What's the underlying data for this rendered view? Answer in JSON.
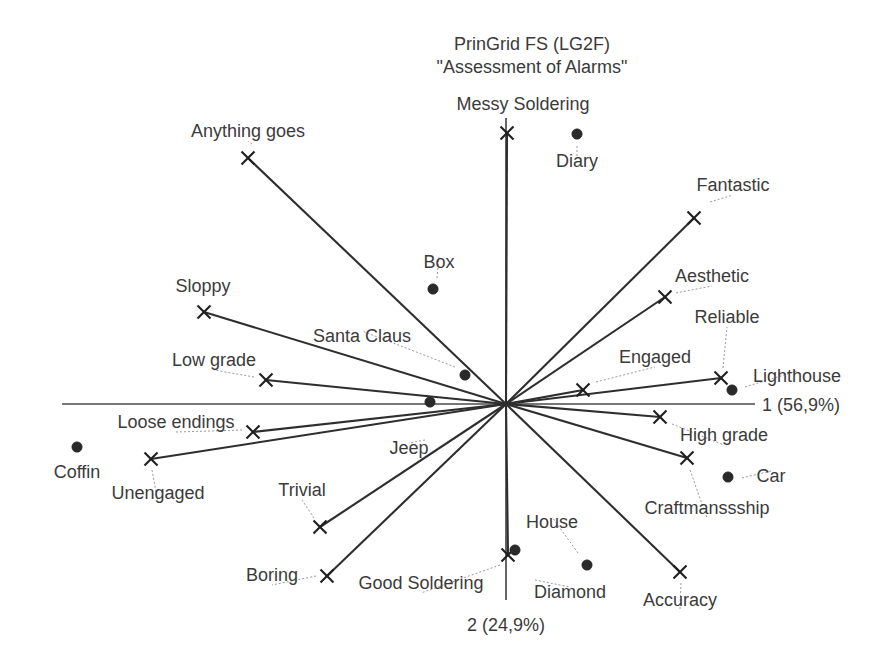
{
  "chart_data": {
    "type": "scatter",
    "title_line1": "PrinGrid FS (LG2F)",
    "title_line2": "\"Assessment of Alarms\"",
    "xlabel": "1 (56,9%)",
    "ylabel": "2 (24,9%)",
    "grid": false,
    "legend": "none",
    "axis_variance": {
      "component_1_percent": "56,9%",
      "component_2_percent": "24,9%"
    },
    "origin": {
      "x": 506,
      "y": 404
    },
    "axis_extent": {
      "x_min": 62,
      "x_max": 755,
      "y_min": 118,
      "y_max": 600
    },
    "constructs": [
      {
        "name": "Messy Soldering",
        "x": 507,
        "y": 133,
        "label_x": 523,
        "label_y": 110,
        "anchor": "middle",
        "leader": false
      },
      {
        "name": "Anything goes",
        "x": 248,
        "y": 158,
        "label_x": 248,
        "label_y": 137,
        "anchor": "middle",
        "leader": true,
        "leader_x": 252,
        "leader_y": 144
      },
      {
        "name": "Fantastic",
        "x": 694,
        "y": 218,
        "label_x": 733,
        "label_y": 191,
        "anchor": "middle",
        "leader": true,
        "leader_x": 710,
        "leader_y": 202
      },
      {
        "name": "Sloppy",
        "x": 204,
        "y": 312,
        "label_x": 203,
        "label_y": 292,
        "anchor": "middle",
        "leader": false
      },
      {
        "name": "Aesthetic",
        "x": 665,
        "y": 297,
        "label_x": 712,
        "label_y": 282,
        "anchor": "middle",
        "leader": true,
        "leader_x": 676,
        "leader_y": 293
      },
      {
        "name": "Reliable",
        "x": 721,
        "y": 378,
        "label_x": 727,
        "label_y": 323,
        "anchor": "middle",
        "leader": true,
        "leader_x": 723,
        "leader_y": 368
      },
      {
        "name": "Low grade",
        "x": 266,
        "y": 380,
        "label_x": 214,
        "label_y": 366,
        "anchor": "middle",
        "leader": true,
        "leader_x": 254,
        "leader_y": 377
      },
      {
        "name": "Engaged",
        "x": 583,
        "y": 390,
        "label_x": 655,
        "label_y": 363,
        "anchor": "middle",
        "leader": true,
        "leader_x": 596,
        "leader_y": 382
      },
      {
        "name": "Loose endings",
        "x": 253,
        "y": 432,
        "label_x": 176,
        "label_y": 428,
        "anchor": "middle",
        "leader": true,
        "leader_x": 242,
        "leader_y": 430
      },
      {
        "name": "High grade",
        "x": 660,
        "y": 417,
        "label_x": 724,
        "label_y": 441,
        "anchor": "middle",
        "leader": true,
        "leader_x": 672,
        "leader_y": 424
      },
      {
        "name": "Unengaged",
        "x": 151,
        "y": 459,
        "label_x": 158,
        "label_y": 499,
        "anchor": "middle",
        "leader": true,
        "leader_x": 152,
        "leader_y": 470
      },
      {
        "name": "Craftmanssship",
        "x": 687,
        "y": 458,
        "label_x": 707,
        "label_y": 514,
        "anchor": "middle",
        "leader": true,
        "leader_x": 690,
        "leader_y": 470
      },
      {
        "name": "Trivial",
        "x": 320,
        "y": 527,
        "label_x": 302,
        "label_y": 496,
        "anchor": "middle",
        "leader": true,
        "leader_x": 314,
        "leader_y": 518
      },
      {
        "name": "Boring",
        "x": 327,
        "y": 576,
        "label_x": 272,
        "label_y": 581,
        "anchor": "middle",
        "leader": true,
        "leader_x": 316,
        "leader_y": 576
      },
      {
        "name": "Good Soldering",
        "x": 508,
        "y": 555,
        "label_x": 421,
        "label_y": 589,
        "anchor": "middle",
        "leader": true,
        "leader_x": 500,
        "leader_y": 565
      },
      {
        "name": "Accuracy",
        "x": 680,
        "y": 572,
        "label_x": 680,
        "label_y": 606,
        "anchor": "middle",
        "leader": true,
        "leader_x": 681,
        "leader_y": 583
      }
    ],
    "elements": [
      {
        "name": "Diary",
        "x": 577,
        "y": 134,
        "label_x": 577,
        "label_y": 167,
        "anchor": "middle",
        "leader": true,
        "leader_x": 577,
        "leader_y": 146
      },
      {
        "name": "Box",
        "x": 433,
        "y": 289,
        "label_x": 439,
        "label_y": 268,
        "anchor": "middle",
        "leader": true,
        "leader_x": 437,
        "leader_y": 278
      },
      {
        "name": "Santa Claus",
        "x": 465,
        "y": 375,
        "label_x": 362,
        "label_y": 342,
        "anchor": "middle",
        "leader": true,
        "leader_x": 455,
        "leader_y": 367
      },
      {
        "name": "Lighthouse",
        "x": 732,
        "y": 390,
        "label_x": 797,
        "label_y": 382,
        "anchor": "middle",
        "leader": true,
        "leader_x": 745,
        "leader_y": 387
      },
      {
        "name": "Coffin",
        "x": 77,
        "y": 447,
        "label_x": 77,
        "label_y": 478,
        "anchor": "middle",
        "leader": false
      },
      {
        "name": "Jeep",
        "x": 430,
        "y": 402,
        "label_x": 409,
        "label_y": 454,
        "anchor": "middle",
        "leader": true,
        "leader_x": 425,
        "leader_y": 440
      },
      {
        "name": "Car",
        "x": 728,
        "y": 477,
        "label_x": 771,
        "label_y": 482,
        "anchor": "middle",
        "leader": true,
        "leader_x": 742,
        "leader_y": 478
      },
      {
        "name": "Diamond",
        "x": 515,
        "y": 550,
        "label_x": 570,
        "label_y": 598,
        "anchor": "middle",
        "leader": true,
        "leader_x": 535,
        "leader_y": 580
      },
      {
        "name": "House",
        "x": 587,
        "y": 565,
        "label_x": 552,
        "label_y": 528,
        "anchor": "middle",
        "leader": true,
        "leader_x": 578,
        "leader_y": 553
      }
    ]
  },
  "colors": {
    "line": "#2e2e2e",
    "axis": "#4a4a4a",
    "text": "#3b3b3b",
    "marker": "#1f1f1f",
    "background": "#ffffff"
  }
}
